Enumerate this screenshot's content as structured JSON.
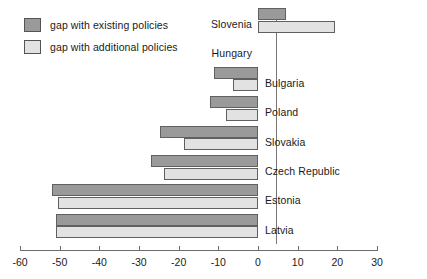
{
  "legend": {
    "position": "top-left",
    "items": [
      {
        "label": "gap with existing policies",
        "color": "#9a9a9a",
        "key": "existing"
      },
      {
        "label": "gap with additional policies",
        "color": "#e2e2e2",
        "key": "additional"
      }
    ]
  },
  "chart_data": {
    "type": "bar",
    "orientation": "horizontal",
    "title": "",
    "subtitle": "",
    "xlabel": "",
    "ylabel": "",
    "xlim": [
      -60,
      30
    ],
    "xticks": [
      -60,
      -50,
      -40,
      -30,
      -20,
      -10,
      0,
      10,
      20,
      30
    ],
    "xticklabels": [
      "-60",
      "-50",
      "-40",
      "-30",
      "-20",
      "-10",
      "0",
      "10",
      "20",
      "30"
    ],
    "grid": false,
    "zero_line": true,
    "categories": [
      "Slovenia",
      "Hungary",
      "Bulgaria",
      "Poland",
      "Slovakia",
      "Czech Republic",
      "Estonia",
      "Latvia"
    ],
    "series": [
      {
        "name": "gap with existing policies",
        "color": "#9a9a9a",
        "values": [
          7,
          0,
          -11.2,
          -12.2,
          -24.8,
          -27,
          -52,
          -51
        ]
      },
      {
        "name": "gap with additional policies",
        "color": "#e2e2e2",
        "values": [
          19.5,
          0,
          -6.3,
          -8,
          -18.7,
          -23.7,
          -50.5,
          -51
        ]
      }
    ]
  },
  "colors": {
    "existing": "#9a9a9a",
    "additional": "#e2e2e2",
    "bar_border": "#606060",
    "axis": "#6e6e6e",
    "text": "#1a1a1a",
    "background": "#ffffff"
  }
}
